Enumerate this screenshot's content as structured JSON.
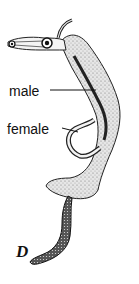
{
  "figure": {
    "panel_letter": "D",
    "labels": {
      "male": "male",
      "female": "female"
    },
    "colors": {
      "ink": "#111111",
      "stipple": "#9a9a9a",
      "background": "#ffffff"
    }
  }
}
